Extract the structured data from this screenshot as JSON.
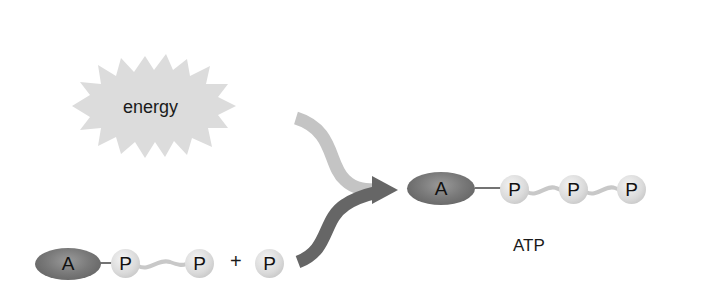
{
  "diagram": {
    "title": "",
    "energy_burst": {
      "label": "energy",
      "color": "#d8d8d8"
    },
    "reactants": {
      "adp": {
        "adenosine_label": "A",
        "phosphates": [
          "P",
          "P"
        ]
      },
      "plus_sign": "+",
      "phosphate": {
        "label": "P"
      }
    },
    "product": {
      "adenosine_label": "A",
      "phosphates": [
        "P",
        "P",
        "P"
      ],
      "name": "ATP"
    },
    "arrows": {
      "energy_arrow_color": "#c4c4c4",
      "reactant_arrow_color": "#6a6a6a"
    }
  }
}
